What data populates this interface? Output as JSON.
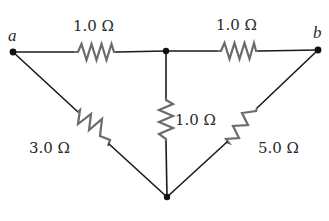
{
  "diagram": {
    "type": "resistor-network",
    "terminals": [
      {
        "id": "a",
        "label": "a"
      },
      {
        "id": "b",
        "label": "b"
      }
    ],
    "nodes": [
      "a",
      "top-junction",
      "b",
      "bottom-junction"
    ],
    "resistors": [
      {
        "id": "r-top-left",
        "between": [
          "a",
          "top-junction"
        ],
        "label": "1.0 Ω",
        "ohms": 1.0
      },
      {
        "id": "r-top-right",
        "between": [
          "top-junction",
          "b"
        ],
        "label": "1.0 Ω",
        "ohms": 1.0
      },
      {
        "id": "r-middle",
        "between": [
          "top-junction",
          "bottom-junction"
        ],
        "label": "1.0 Ω",
        "ohms": 1.0
      },
      {
        "id": "r-left-diagonal",
        "between": [
          "a",
          "bottom-junction"
        ],
        "label": "3.0 Ω",
        "ohms": 3.0
      },
      {
        "id": "r-right-diagonal",
        "between": [
          "b",
          "bottom-junction"
        ],
        "label": "5.0 Ω",
        "ohms": 5.0
      }
    ],
    "colors": {
      "wire": "#1a1a1a",
      "resistor": "#6b6b6b",
      "text": "#2a2a2a",
      "background": "#ffffff"
    }
  }
}
